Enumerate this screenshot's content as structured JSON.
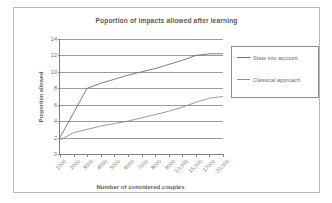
{
  "chart_data": {
    "type": "line",
    "title": "Poportion of impacts allowed after learning",
    "xlabel": "Number of considered couples",
    "ylabel": "Proportion allowed",
    "grid": "horizontal",
    "legend_position": "right",
    "ylim": [
      0,
      14
    ],
    "yticks": [
      "0",
      "2",
      "4",
      "6",
      "8",
      "10",
      "12",
      "14"
    ],
    "categories": [
      "1000",
      "2000",
      "3000",
      "4000",
      "5000",
      "6000",
      "7000",
      "8000",
      "9000",
      "10000",
      "15000",
      "17000",
      "20000"
    ],
    "xtick_labels": [
      "1000",
      "2000",
      "3000",
      "4000",
      "5000",
      "6000",
      "7000",
      "8000",
      "9000",
      "10,000",
      "15,000",
      "17000",
      "20,000"
    ],
    "series": [
      {
        "name": "State into account",
        "color": "#6e6e6e",
        "values": [
          2.0,
          5.0,
          8.0,
          8.6,
          9.1,
          9.6,
          10.0,
          10.4,
          10.9,
          11.4,
          12.0,
          12.2,
          12.2
        ]
      },
      {
        "name": "Classical approach",
        "color": "#8f8f8f",
        "values": [
          1.7,
          2.6,
          3.0,
          3.4,
          3.7,
          4.0,
          4.4,
          4.8,
          5.2,
          5.7,
          6.3,
          6.8,
          7.0
        ]
      }
    ]
  },
  "legend": {
    "entries": [
      {
        "label": "State into account"
      },
      {
        "label": "Classical approach"
      }
    ]
  },
  "colors": {
    "frame_border": "#b8b8b8",
    "axis": "#808080",
    "gridline": "#9a9a9a",
    "text": "#6b6b6b",
    "title_text": "#5a5a5a"
  }
}
